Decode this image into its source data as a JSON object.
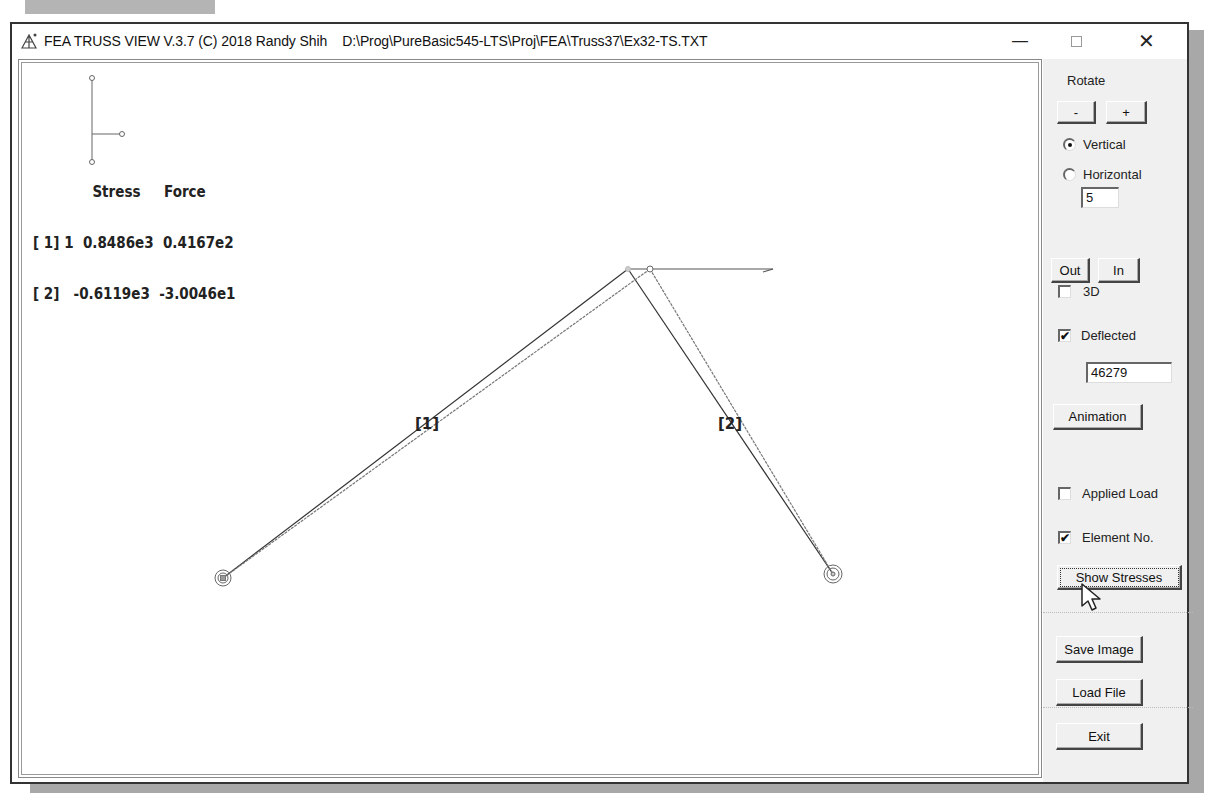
{
  "window": {
    "title": "FEA TRUSS VIEW V.3.7 (C) 2018 Randy Shih    D:\\Prog\\PureBasic545-LTS\\Proj\\FEA\\Truss37\\Ex32-TS.TXT",
    "controls": {
      "minimize": "—",
      "maximize": "□",
      "close": "✕"
    }
  },
  "readout": {
    "header": "Stress     Force",
    "rows": [
      {
        "id": "[ 1]",
        "suffix": "1",
        "stress": "0.8486e3",
        "force": "0.4167e2"
      },
      {
        "id": "[ 2]",
        "suffix": "",
        "stress": "-0.6119e3",
        "force": "-3.0046e1"
      }
    ],
    "line1": "[ 1] 1  0.8486e3  0.4167e2",
    "line2": "[ 2]   -0.6119e3  -3.0046e1"
  },
  "truss": {
    "elements": [
      {
        "label": "[1]",
        "label_pos": [
          414,
          413
        ]
      },
      {
        "label": "[2]",
        "label_pos": [
          717,
          413
        ]
      }
    ],
    "nodes": {
      "support_left": [
        222,
        577
      ],
      "support_right": [
        832,
        573
      ],
      "apex_original": [
        627,
        268
      ],
      "apex_deflected": [
        649,
        268
      ]
    },
    "load_arrow_end": [
      772,
      268
    ]
  },
  "panel": {
    "rotate_label": "Rotate",
    "rotate_minus": "-",
    "rotate_plus": "+",
    "radio_vertical": "Vertical",
    "radio_horizontal": "Horizontal",
    "rotate_selected": "Vertical",
    "rotate_step": "5",
    "zoom_out": "Out",
    "zoom_in": "In",
    "chk_3d": "3D",
    "chk_3d_checked": false,
    "chk_deflected": "Deflected",
    "chk_deflected_checked": true,
    "deflection_scale": "46279",
    "animation": "Animation",
    "chk_applied_load": "Applied Load",
    "chk_applied_load_checked": false,
    "chk_element_no": "Element No.",
    "chk_element_no_checked": true,
    "show_stresses": "Show Stresses",
    "save_image": "Save Image",
    "load_file": "Load File",
    "exit": "Exit",
    "check_mark": "✔"
  }
}
